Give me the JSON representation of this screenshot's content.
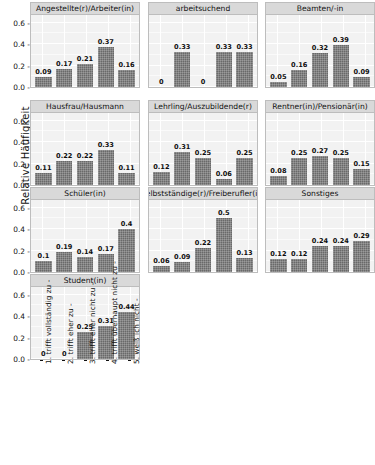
{
  "chart_data": {
    "type": "bar",
    "title": "",
    "xlabel": "",
    "ylabel": "Relative Häufigkeit",
    "ylim": [
      0,
      0.68
    ],
    "yticks": [
      "0.0",
      "0.2",
      "0.4",
      "0.6"
    ],
    "ytick_values": [
      0.0,
      0.2,
      0.4,
      0.6
    ],
    "grid": true,
    "legend": "none",
    "facet_layout": {
      "rows": 4,
      "cols": 3
    },
    "categories": [
      "1. trifft vollständig zu",
      "2. trifft eher zu",
      "3. trifft eher nicht zu",
      "4. trifft überhaupt nicht zu",
      "5. weiß ich nicht"
    ],
    "panels": [
      {
        "name": "Angestellte(r)/Arbeiter(in)",
        "values": [
          0.09,
          0.17,
          0.21,
          0.37,
          0.16
        ],
        "labels": [
          "0.09",
          "0.17",
          "0.21",
          "0.37",
          "0.16"
        ]
      },
      {
        "name": "arbeitsuchend",
        "values": [
          0,
          0.33,
          0,
          0.33,
          0.33
        ],
        "labels": [
          "0",
          "0.33",
          "0",
          "0.33",
          "0.33"
        ]
      },
      {
        "name": "Beamten/-in",
        "values": [
          0.05,
          0.16,
          0.32,
          0.39,
          0.09
        ],
        "labels": [
          "0.05",
          "0.16",
          "0.32",
          "0.39",
          "0.09"
        ]
      },
      {
        "name": "Hausfrau/Hausmann",
        "values": [
          0.11,
          0.22,
          0.22,
          0.33,
          0.11
        ],
        "labels": [
          "0.11",
          "0.22",
          "0.22",
          "0.33",
          "0.11"
        ]
      },
      {
        "name": "Lehrling/Auszubildende(r)",
        "values": [
          0.12,
          0.31,
          0.25,
          0.06,
          0.25
        ],
        "labels": [
          "0.12",
          "0.31",
          "0.25",
          "0.06",
          "0.25"
        ]
      },
      {
        "name": "Rentner(in)/Pensionär(in)",
        "values": [
          0.08,
          0.25,
          0.27,
          0.25,
          0.15
        ],
        "labels": [
          "0.08",
          "0.25",
          "0.27",
          "0.25",
          "0.15"
        ]
      },
      {
        "name": "Schüler(in)",
        "values": [
          0.1,
          0.19,
          0.14,
          0.17,
          0.4
        ],
        "labels": [
          "0.1",
          "0.19",
          "0.14",
          "0.17",
          "0.4"
        ]
      },
      {
        "name": "Selbstständige(r)/Freiberufler(in)",
        "values": [
          0.06,
          0.09,
          0.22,
          0.5,
          0.13
        ],
        "labels": [
          "0.06",
          "0.09",
          "0.22",
          "0.5",
          "0.13"
        ]
      },
      {
        "name": "Sonstiges",
        "values": [
          0.12,
          0.12,
          0.24,
          0.24,
          0.29
        ],
        "labels": [
          "0.12",
          "0.12",
          "0.24",
          "0.24",
          "0.29"
        ]
      },
      {
        "name": "Student(in)",
        "values": [
          0,
          0,
          0.25,
          0.31,
          0.44
        ],
        "labels": [
          "0",
          "0",
          "0.25",
          "0.31",
          "0.44"
        ]
      }
    ],
    "colors": {
      "bar_fill": "#696969",
      "panel_background": "#f2f2f2",
      "strip_background": "#d9d9d9",
      "gridline": "#ffffff",
      "text": "#111111"
    }
  }
}
